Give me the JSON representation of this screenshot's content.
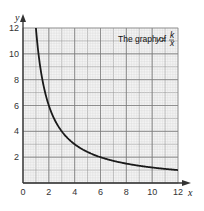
{
  "chart_data": {
    "type": "line",
    "title_parts": {
      "prefix": "The graph of ",
      "var": "y",
      "eq": " = ",
      "num": "k",
      "den": "x"
    },
    "xlabel": "x",
    "ylabel": "y",
    "xlim": [
      0,
      12
    ],
    "ylim": [
      0,
      12
    ],
    "xticks": [
      0,
      2,
      4,
      6,
      8,
      10,
      12
    ],
    "yticks": [
      2,
      4,
      6,
      8,
      10,
      12
    ],
    "grid": true,
    "grid_minor_step": 0.2,
    "grid_major_step": 1,
    "k": 12,
    "series": [
      {
        "name": "y = 12/x",
        "x": [
          1,
          1.5,
          2,
          2.5,
          3,
          4,
          5,
          6,
          7,
          8,
          9,
          10,
          11,
          12
        ],
        "y": [
          12,
          8,
          6,
          4.8,
          4,
          3,
          2.4,
          2,
          1.71,
          1.5,
          1.33,
          1.2,
          1.09,
          1
        ]
      }
    ]
  },
  "colors": {
    "grid_minor": "#d6d6d6",
    "grid_major": "#9a9a9a",
    "axis": "#333333",
    "curve": "#1a1a1a"
  }
}
